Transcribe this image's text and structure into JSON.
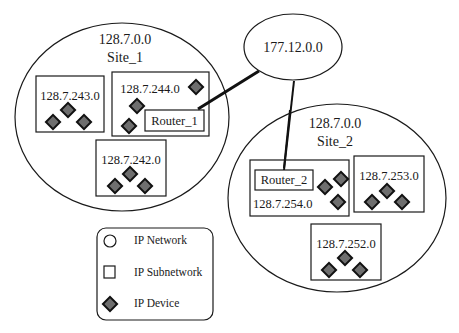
{
  "colors": {
    "stroke": "#1a1a1a",
    "device_fill": "#6e6e6e",
    "device_stroke": "#111111",
    "background": "#ffffff"
  },
  "backbone": {
    "label": "177.12.0.0"
  },
  "sites": [
    {
      "network": "128.7.0.0",
      "name": "Site_1",
      "router": "Router_1",
      "subnets": [
        {
          "label": "128.7.243.0",
          "devices": 3
        },
        {
          "label": "128.7.244.0",
          "devices": 3,
          "has_router": true
        },
        {
          "label": "128.7.242.0",
          "devices": 3
        }
      ]
    },
    {
      "network": "128.7.0.0",
      "name": "Site_2",
      "router": "Router_2",
      "subnets": [
        {
          "label": "128.7.254.0",
          "devices": 3,
          "has_router": true
        },
        {
          "label": "128.7.253.0",
          "devices": 3
        },
        {
          "label": "128.7.252.0",
          "devices": 3
        }
      ]
    }
  ],
  "legend": {
    "items": [
      {
        "icon": "circle-icon",
        "label": "IP Network"
      },
      {
        "icon": "square-icon",
        "label": "IP Subnetwork"
      },
      {
        "icon": "diamond-icon",
        "label": "IP Device"
      }
    ]
  }
}
